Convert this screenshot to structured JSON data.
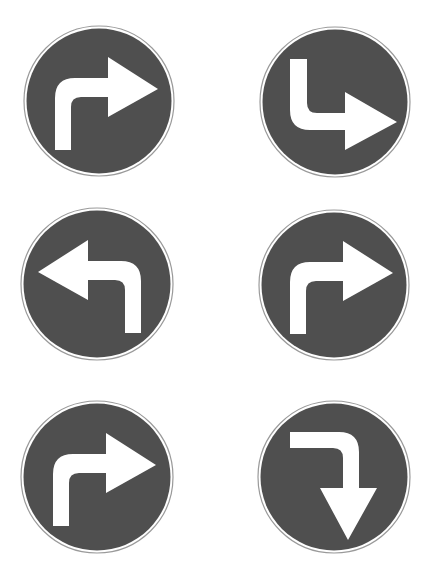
{
  "figure": {
    "title": "Mandatory direction road signs",
    "background": "#ffffff",
    "sign_fill": "#4f4f4f",
    "arrow_fill": "#ffffff",
    "rim_stroke": "#9a9a9a",
    "layout": {
      "rows": 3,
      "columns": 2
    }
  },
  "signs": [
    {
      "id": "sign-1",
      "label": "Turn right ahead",
      "type": "turn-right",
      "row": 1,
      "column": 1,
      "center": [
        99,
        101
      ],
      "radius": 74
    },
    {
      "id": "sign-2",
      "label": "Go down then turn right",
      "type": "down-then-right",
      "row": 1,
      "column": 2,
      "center": [
        335,
        102
      ],
      "radius": 74
    },
    {
      "id": "sign-3",
      "label": "Turn left ahead",
      "type": "turn-left",
      "row": 2,
      "column": 1,
      "center": [
        97,
        284
      ],
      "radius": 75
    },
    {
      "id": "sign-4",
      "label": "Turn right ahead",
      "type": "turn-right",
      "row": 2,
      "column": 2,
      "center": [
        334,
        285
      ],
      "radius": 74
    },
    {
      "id": "sign-5",
      "label": "Turn right ahead",
      "type": "turn-right",
      "row": 3,
      "column": 1,
      "center": [
        97,
        477
      ],
      "radius": 75
    },
    {
      "id": "sign-6",
      "label": "Go right then turn down",
      "type": "right-then-down",
      "row": 3,
      "column": 2,
      "center": [
        334,
        477
      ],
      "radius": 75
    }
  ]
}
